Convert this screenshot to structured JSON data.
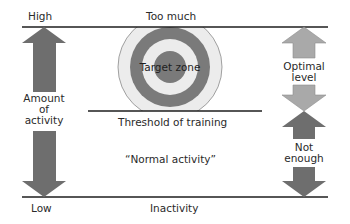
{
  "diagram": {
    "left_axis": {
      "top_label": "High",
      "bottom_label": "Low",
      "middle_label": [
        "Amount",
        "of",
        "activity"
      ]
    },
    "bands": {
      "top_line_label": "Too much",
      "threshold_line_label": "Threshold of training",
      "middle_label": "“Normal activity”",
      "bottom_line_label": "Inactivity"
    },
    "target": {
      "label": "Target zone"
    },
    "right_arrows": {
      "upper": [
        "Optimal",
        "level"
      ],
      "lower": [
        "Not",
        "enough"
      ]
    },
    "colors": {
      "dark_arrow": "#6e6e6e",
      "light_arrow": "#a9a9a9",
      "ring_dark": "#7a7a7a",
      "ring_light": "#ececec",
      "lines": "#1e1e1e"
    }
  }
}
